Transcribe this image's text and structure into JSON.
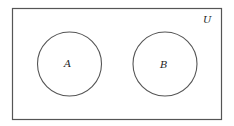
{
  "diagram": {
    "type": "venn",
    "universe_label": "U",
    "sets": [
      {
        "label": "A"
      },
      {
        "label": "B"
      }
    ],
    "colors": {
      "stroke": "#555555",
      "background": "#ffffff"
    }
  }
}
